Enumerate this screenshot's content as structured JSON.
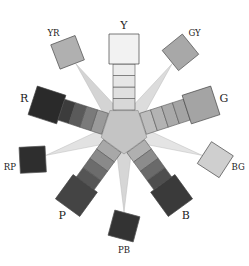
{
  "diagram": {
    "type": "munsell-hue-wheel",
    "center": [
      124,
      130
    ],
    "principal_hues": [
      {
        "label": "Y",
        "angle": -90,
        "chip": "#f2f2f2",
        "steps": [
          "#d8d8d8",
          "#e0e0e0",
          "#e6e6e6",
          "#ececec"
        ]
      },
      {
        "label": "G",
        "angle": -18,
        "chip": "#a4a4a4",
        "steps": [
          "#bdbdbd",
          "#b3b3b3",
          "#aaaaaa",
          "#a4a4a4"
        ]
      },
      {
        "label": "B",
        "angle": 54,
        "chip": "#3a3a3a",
        "steps": [
          "#b0b0b0",
          "#8c8c8c",
          "#6a6a6a",
          "#4e4e4e"
        ]
      },
      {
        "label": "P",
        "angle": 126,
        "chip": "#444444",
        "steps": [
          "#a8a8a8",
          "#8a8a8a",
          "#6c6c6c",
          "#555555"
        ]
      },
      {
        "label": "R",
        "angle": 198,
        "chip": "#2a2a2a",
        "steps": [
          "#9a9a9a",
          "#7a7a7a",
          "#5a5a5a",
          "#3c3c3c"
        ]
      }
    ],
    "intermediate_hues": [
      {
        "label": "GY",
        "angle": -54,
        "chip": "#a8a8a8",
        "wedge": "#dcdcdc"
      },
      {
        "label": "BG",
        "angle": 18,
        "chip": "#cfcfcf",
        "wedge": "#e4e4e4"
      },
      {
        "label": "PB",
        "angle": 90,
        "chip": "#333333",
        "wedge": "#d6d6d6"
      },
      {
        "label": "RP",
        "angle": 162,
        "chip": "#2e2e2e",
        "wedge": "#e2e2e2"
      },
      {
        "label": "YR",
        "angle": -126,
        "chip": "#b0b0b0",
        "wedge": "#d4d4d4"
      }
    ],
    "center_fill": "#c4c4c4"
  }
}
